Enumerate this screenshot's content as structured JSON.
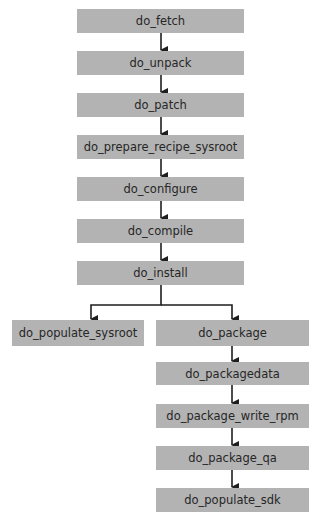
{
  "diagram": {
    "type": "flowchart",
    "colors": {
      "box_fill": "#b3b3b3",
      "text": "#262626",
      "arrow": "#1e1e1e",
      "background": "#ffffff"
    },
    "nodes": [
      {
        "id": "do_fetch",
        "label": "do_fetch"
      },
      {
        "id": "do_unpack",
        "label": "do_unpack"
      },
      {
        "id": "do_patch",
        "label": "do_patch"
      },
      {
        "id": "do_prepare_recipe_sysroot",
        "label": "do_prepare_recipe_sysroot"
      },
      {
        "id": "do_configure",
        "label": "do_configure"
      },
      {
        "id": "do_compile",
        "label": "do_compile"
      },
      {
        "id": "do_install",
        "label": "do_install"
      },
      {
        "id": "do_populate_sysroot",
        "label": "do_populate_sysroot"
      },
      {
        "id": "do_package",
        "label": "do_package"
      },
      {
        "id": "do_packagedata",
        "label": "do_packagedata"
      },
      {
        "id": "do_package_write_rpm",
        "label": "do_package_write_rpm"
      },
      {
        "id": "do_package_qa",
        "label": "do_package_qa"
      },
      {
        "id": "do_populate_sdk",
        "label": "do_populate_sdk"
      }
    ],
    "edges": [
      {
        "from": "do_fetch",
        "to": "do_unpack"
      },
      {
        "from": "do_unpack",
        "to": "do_patch"
      },
      {
        "from": "do_patch",
        "to": "do_prepare_recipe_sysroot"
      },
      {
        "from": "do_prepare_recipe_sysroot",
        "to": "do_configure"
      },
      {
        "from": "do_configure",
        "to": "do_compile"
      },
      {
        "from": "do_compile",
        "to": "do_install"
      },
      {
        "from": "do_install",
        "to": "do_populate_sysroot"
      },
      {
        "from": "do_install",
        "to": "do_package"
      },
      {
        "from": "do_package",
        "to": "do_packagedata"
      },
      {
        "from": "do_packagedata",
        "to": "do_package_write_rpm"
      },
      {
        "from": "do_package_write_rpm",
        "to": "do_package_qa"
      },
      {
        "from": "do_package_qa",
        "to": "do_populate_sdk"
      }
    ]
  }
}
